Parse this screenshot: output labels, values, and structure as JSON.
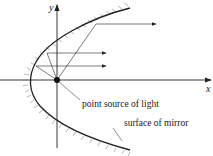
{
  "diagram": {
    "axes": {
      "x_label": "x",
      "y_label": "y"
    },
    "labels": {
      "point_source": "point source of light",
      "mirror_surface": "surface of mirror"
    },
    "colors": {
      "stroke": "#222222",
      "hatch": "#888888",
      "background": "#ffffff"
    }
  }
}
